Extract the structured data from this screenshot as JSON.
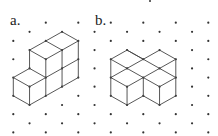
{
  "diagram": {
    "colors": {
      "background": "#ffffff",
      "dot": "#333333",
      "edge": "#444444",
      "label": "#222222"
    },
    "lattice": {
      "x0": 13.3,
      "dx": 16.25,
      "y0": 13.5,
      "dy": 9.15,
      "i_range": [
        0,
        12
      ],
      "j_range": [
        1,
        13
      ],
      "dot_parity": "odd",
      "skip": [
        [
          0,
          1
        ]
      ],
      "extra_dots_px": [
        [
          150,
          1
        ]
      ]
    },
    "panels": [
      {
        "id": "a",
        "label": "a.",
        "edges": [
          [
            [
              1,
              4
            ],
            [
              2,
              3
            ]
          ],
          [
            [
              2,
              3
            ],
            [
              3,
              2
            ]
          ],
          [
            [
              3,
              2
            ],
            [
              4,
              3
            ]
          ],
          [
            [
              2,
              3
            ],
            [
              3,
              4
            ]
          ],
          [
            [
              3,
              4
            ],
            [
              4,
              3
            ]
          ],
          [
            [
              1,
              4
            ],
            [
              2,
              5
            ]
          ],
          [
            [
              2,
              5
            ],
            [
              3,
              4
            ]
          ],
          [
            [
              1,
              4
            ],
            [
              1,
              6
            ]
          ],
          [
            [
              2,
              5
            ],
            [
              2,
              7
            ]
          ],
          [
            [
              3,
              4
            ],
            [
              3,
              6
            ]
          ],
          [
            [
              3,
              6
            ],
            [
              3,
              8
            ]
          ],
          [
            [
              4,
              3
            ],
            [
              4,
              5
            ]
          ],
          [
            [
              4,
              5
            ],
            [
              4,
              7
            ]
          ],
          [
            [
              3,
              6
            ],
            [
              4,
              5
            ]
          ],
          [
            [
              2,
              7
            ],
            [
              3,
              6
            ]
          ],
          [
            [
              1,
              6
            ],
            [
              0,
              7
            ]
          ],
          [
            [
              1,
              6
            ],
            [
              2,
              7
            ]
          ],
          [
            [
              0,
              7
            ],
            [
              1,
              8
            ]
          ],
          [
            [
              1,
              8
            ],
            [
              2,
              7
            ]
          ],
          [
            [
              0,
              7
            ],
            [
              0,
              9
            ]
          ],
          [
            [
              1,
              8
            ],
            [
              1,
              10
            ]
          ],
          [
            [
              2,
              7
            ],
            [
              2,
              9
            ]
          ],
          [
            [
              0,
              9
            ],
            [
              1,
              10
            ]
          ],
          [
            [
              1,
              10
            ],
            [
              2,
              9
            ]
          ],
          [
            [
              2,
              9
            ],
            [
              3,
              8
            ]
          ],
          [
            [
              3,
              8
            ],
            [
              4,
              7
            ]
          ]
        ]
      },
      {
        "id": "b",
        "label": "b.",
        "edges": [
          [
            [
              6,
              5
            ],
            [
              7,
              4
            ]
          ],
          [
            [
              7,
              4
            ],
            [
              8,
              5
            ]
          ],
          [
            [
              8,
              5
            ],
            [
              9,
              4
            ]
          ],
          [
            [
              9,
              4
            ],
            [
              10,
              5
            ]
          ],
          [
            [
              6,
              5
            ],
            [
              7,
              6
            ]
          ],
          [
            [
              7,
              6
            ],
            [
              8,
              7
            ]
          ],
          [
            [
              7,
              4
            ],
            [
              8,
              5
            ]
          ],
          [
            [
              8,
              5
            ],
            [
              9,
              6
            ]
          ],
          [
            [
              9,
              6
            ],
            [
              10,
              7
            ]
          ],
          [
            [
              8,
              5
            ],
            [
              7,
              6
            ]
          ],
          [
            [
              7,
              6
            ],
            [
              6,
              7
            ]
          ],
          [
            [
              10,
              5
            ],
            [
              9,
              6
            ]
          ],
          [
            [
              9,
              6
            ],
            [
              8,
              7
            ]
          ],
          [
            [
              6,
              7
            ],
            [
              7,
              8
            ]
          ],
          [
            [
              7,
              8
            ],
            [
              8,
              7
            ]
          ],
          [
            [
              8,
              7
            ],
            [
              9,
              8
            ]
          ],
          [
            [
              9,
              8
            ],
            [
              10,
              7
            ]
          ],
          [
            [
              6,
              5
            ],
            [
              6,
              7
            ]
          ],
          [
            [
              6,
              7
            ],
            [
              6,
              9
            ]
          ],
          [
            [
              10,
              5
            ],
            [
              10,
              7
            ]
          ],
          [
            [
              10,
              7
            ],
            [
              10,
              9
            ]
          ],
          [
            [
              7,
              8
            ],
            [
              7,
              10
            ]
          ],
          [
            [
              8,
              7
            ],
            [
              8,
              9
            ]
          ],
          [
            [
              9,
              8
            ],
            [
              9,
              10
            ]
          ],
          [
            [
              6,
              9
            ],
            [
              7,
              10
            ]
          ],
          [
            [
              7,
              10
            ],
            [
              8,
              9
            ]
          ],
          [
            [
              8,
              9
            ],
            [
              9,
              10
            ]
          ],
          [
            [
              9,
              10
            ],
            [
              10,
              9
            ]
          ]
        ]
      }
    ]
  }
}
